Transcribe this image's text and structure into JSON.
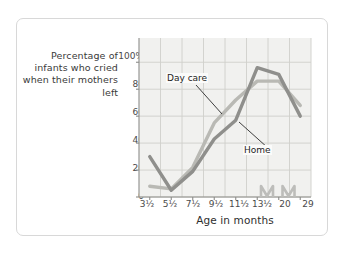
{
  "figure": {
    "background_color": "#ffffff",
    "border_color": "#d8d8d8",
    "plot_background_color": "#f1f1ef",
    "grid_color": "#cfcfcb"
  },
  "chart_data": {
    "type": "line",
    "title": "",
    "xlabel": "Age in months",
    "ylabel": "Percentage of infants who cried when their mothers left",
    "categories": [
      "3½",
      "5½",
      "7½",
      "9½",
      "11½",
      "13½",
      "20",
      "29"
    ],
    "x_tick_labels": [
      "3½",
      "5½",
      "7½",
      "9½",
      "11½",
      "13½",
      "20",
      "29"
    ],
    "y_tick_labels": [
      "0",
      "20",
      "40",
      "60",
      "80",
      "100%"
    ],
    "y_tick_values": [
      0,
      20,
      40,
      60,
      80,
      100
    ],
    "ylim": [
      0,
      118
    ],
    "grid": true,
    "legend_position": "inline-annotations",
    "axis_break": true,
    "axis_break_after": [
      "13½",
      "20"
    ],
    "series": [
      {
        "name": "Day care",
        "color": "#b9b9b4",
        "values": [
          8,
          6,
          22,
          55,
          72,
          86,
          86,
          68
        ]
      },
      {
        "name": "Home",
        "color": "#8f8f8c",
        "values": [
          30,
          5,
          19,
          43,
          57,
          96,
          91,
          60
        ]
      }
    ],
    "annotations": [
      {
        "label": "Day care",
        "series": "Day care"
      },
      {
        "label": "Home",
        "series": "Home"
      }
    ]
  },
  "axis": {
    "y_title": "Percentage of infants who cried when their mothers left",
    "x_title": "Age in months"
  }
}
